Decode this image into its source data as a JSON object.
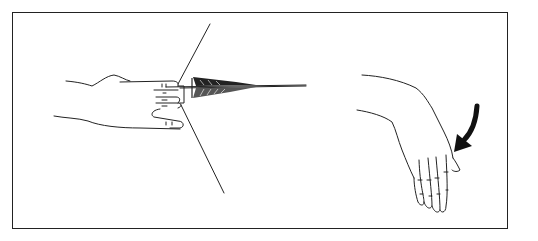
{
  "figure": {
    "panels": [
      {
        "id": "draw",
        "label": "Hand drawing arrow on bowstring"
      },
      {
        "id": "release",
        "label": "Hand after release"
      }
    ],
    "colors": {
      "line": "#222222",
      "background": "#ffffff",
      "frame": "#222222"
    },
    "icons": {
      "motion_arrow": "arrow-down-left-icon"
    }
  }
}
